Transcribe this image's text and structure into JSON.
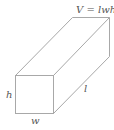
{
  "diagram": {
    "formula": "V = lwh",
    "labels": {
      "height": "h",
      "width": "w",
      "length": "l"
    },
    "colors": {
      "edge": "#a8a8a8",
      "text": "#555555",
      "background": "#ffffff"
    }
  }
}
